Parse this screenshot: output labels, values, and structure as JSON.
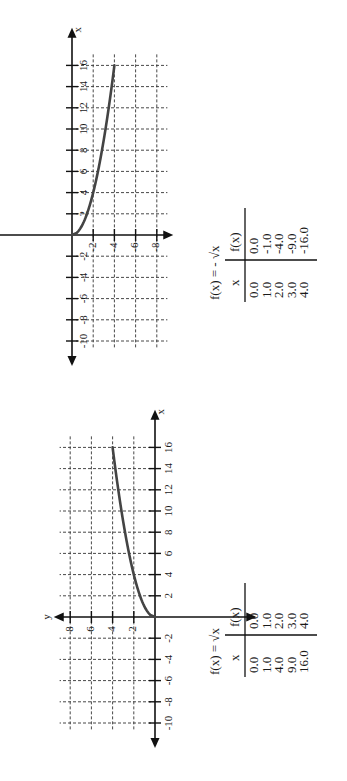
{
  "chart_data": [
    {
      "type": "line",
      "title": "f(x) = -√x",
      "equation_label": "f(x) = - √x",
      "xlabel": "x",
      "ylabel": "y",
      "x_ticks": [
        -10,
        -8,
        -6,
        -4,
        -2,
        2,
        4,
        6,
        8,
        10,
        12,
        14,
        16
      ],
      "y_ticks": [
        2,
        4,
        6,
        8,
        -2,
        -4,
        -6,
        -8
      ],
      "x_tick_labels": [
        "-10",
        "-8",
        "-6",
        "-4",
        "-2",
        "2",
        "4",
        "6",
        "8",
        "10",
        "12",
        "14",
        "16"
      ],
      "y_tick_labels": [
        "-2",
        "-4",
        "-6",
        "-8"
      ],
      "grid": true,
      "xlim": [
        -11,
        17
      ],
      "ylim": [
        -9,
        9
      ],
      "series": [
        {
          "name": "f(x) = -√x",
          "x": [
            0,
            1,
            4,
            9,
            16
          ],
          "y": [
            0,
            -1,
            -2,
            -3,
            -4
          ]
        }
      ],
      "table": {
        "headers": [
          "x",
          "f(x)"
        ],
        "x": [
          "0.0",
          "1.0",
          "2.0",
          "3.0",
          "4.0"
        ],
        "fx": [
          "0.0",
          "-1.0",
          "-4.0",
          "-9.0",
          "-16.0"
        ]
      },
      "rotation_deg": -90
    },
    {
      "type": "line",
      "title": "f(x) = √x",
      "equation_label": "f(x) = √x",
      "xlabel": "x",
      "ylabel": "y",
      "x_ticks": [
        -10,
        -8,
        -6,
        -4,
        -2,
        2,
        4,
        6,
        8,
        10,
        12,
        14,
        16
      ],
      "y_ticks": [
        2,
        4,
        6,
        8
      ],
      "x_tick_labels": [
        "-10",
        "-8",
        "-6",
        "-4",
        "-2",
        "2",
        "4",
        "6",
        "8",
        "10",
        "12",
        "14",
        "16"
      ],
      "y_tick_labels": [
        "2",
        "4",
        "6",
        "8"
      ],
      "grid": true,
      "xlim": [
        -11,
        17
      ],
      "ylim": [
        0,
        9
      ],
      "series": [
        {
          "name": "f(x) = √x",
          "x": [
            0,
            1,
            4,
            9,
            16
          ],
          "y": [
            0,
            1,
            2,
            3,
            4
          ]
        }
      ],
      "table": {
        "headers": [
          "x",
          "f(x)"
        ],
        "x": [
          "0.0",
          "1.0",
          "4.0",
          "9.0",
          "16.0"
        ],
        "fx": [
          "0.0",
          "1.0",
          "2.0",
          "3.0",
          "4.0"
        ]
      },
      "rotation_deg": -90
    }
  ]
}
